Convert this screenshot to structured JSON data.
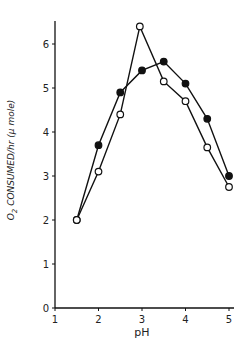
{
  "chart_data": {
    "type": "line",
    "title": "",
    "xlabel": "pH",
    "ylabel": "O2 CONSUMED/hr (μ mole)",
    "ylabel_parts": {
      "prefix": "O",
      "sub": "2",
      "rest": " CONSUMED/hr (μ mole)"
    },
    "xlim": [
      1,
      5
    ],
    "ylim": [
      0,
      6.6
    ],
    "xticks": [
      1,
      2,
      3,
      4,
      5
    ],
    "yticks": [
      0,
      1,
      2,
      3,
      4,
      5,
      6
    ],
    "grid": false,
    "legend": null,
    "series": [
      {
        "name": "filled circles",
        "marker": "filled-circle",
        "color": "#111111",
        "x": [
          1.5,
          2.0,
          2.5,
          3.0,
          3.5,
          4.0,
          4.5,
          5.0
        ],
        "y": [
          2.0,
          3.7,
          4.9,
          5.4,
          5.6,
          5.1,
          4.3,
          3.0
        ]
      },
      {
        "name": "open circles",
        "marker": "open-circle",
        "color": "#111111",
        "x": [
          1.5,
          2.0,
          2.5,
          2.95,
          3.5,
          4.0,
          4.5,
          5.0
        ],
        "y": [
          2.0,
          3.1,
          4.4,
          6.4,
          5.15,
          4.7,
          3.65,
          2.75
        ]
      }
    ]
  }
}
